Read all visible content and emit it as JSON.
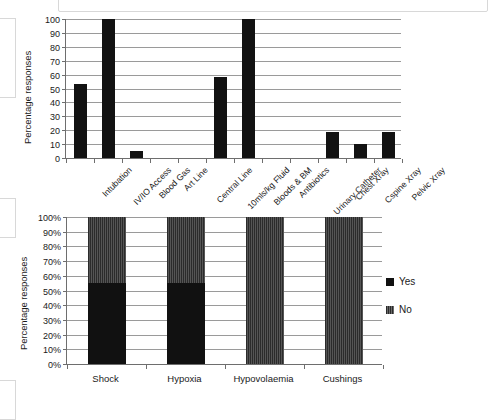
{
  "chart_data": [
    {
      "type": "bar",
      "title": "",
      "xlabel": "",
      "ylabel": "Percentage responses",
      "ylim": [
        0,
        100
      ],
      "ytick_labels": [
        "100",
        "90",
        "80",
        "70",
        "60",
        "50",
        "40",
        "30",
        "20",
        "10",
        "0"
      ],
      "yticks": [
        100,
        90,
        80,
        70,
        60,
        50,
        40,
        30,
        20,
        10,
        0
      ],
      "grid": true,
      "legend": "none",
      "bar_color": "#121212",
      "categories": [
        "Intubation",
        "IV/IO Access",
        "Blood Gas",
        "Art Line",
        "Central Line",
        "10mls/kg Fluid",
        "Bloods & BM",
        "Antibiotics",
        "Urinary Catheter",
        "Chest Xray",
        "Cspine Xray",
        "Pelvic Xray"
      ],
      "values": [
        53,
        100,
        5,
        0,
        0,
        58,
        100,
        0,
        0,
        19,
        10,
        19
      ]
    },
    {
      "type": "bar",
      "subtype": "stacked-100",
      "title": "",
      "xlabel": "",
      "ylabel": "Percentage responses",
      "ylim": [
        0,
        100
      ],
      "ytick_labels": [
        "100%",
        "90%",
        "80%",
        "70%",
        "60%",
        "50%",
        "40%",
        "30%",
        "20%",
        "10%",
        "0%"
      ],
      "yticks": [
        100,
        90,
        80,
        70,
        60,
        50,
        40,
        30,
        20,
        10,
        0
      ],
      "grid": true,
      "legend_position": "right",
      "categories": [
        "Shock",
        "Hypoxia",
        "Hypovolaemia",
        "Cushings"
      ],
      "series": [
        {
          "name": "Yes",
          "color": "#111111",
          "values": [
            55,
            55,
            0,
            0
          ]
        },
        {
          "name": "No",
          "color": "#3f3f3f",
          "values": [
            45,
            45,
            100,
            100
          ]
        }
      ]
    }
  ]
}
